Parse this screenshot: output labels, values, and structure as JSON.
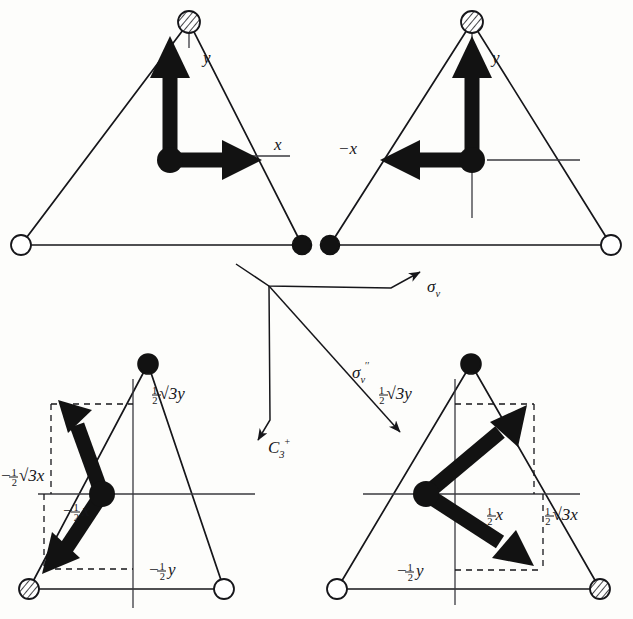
{
  "figure": {
    "colors": {
      "ink": "#16161a",
      "paper": "#fdfdfb",
      "vector": "#121212",
      "thin_line": "#3a3a3f"
    },
    "panels": [
      {
        "id": "top-left",
        "name": "original-orientation",
        "vertices": [
          {
            "position": "top",
            "marker": "hatched"
          },
          {
            "position": "bottom-left",
            "marker": "open"
          },
          {
            "position": "bottom-right",
            "marker": "filled"
          }
        ],
        "axis_labels": [
          {
            "text": "y",
            "name": "y-axis-label"
          },
          {
            "text": "x",
            "name": "x-axis-label"
          }
        ],
        "vectors": [
          {
            "name": "y-vector",
            "direction": "up",
            "label": "y"
          },
          {
            "name": "x-vector",
            "direction": "right",
            "label": "x"
          }
        ]
      },
      {
        "id": "top-right",
        "name": "sigma-v-reflected",
        "vertices": [
          {
            "position": "top",
            "marker": "hatched"
          },
          {
            "position": "bottom-left",
            "marker": "filled"
          },
          {
            "position": "bottom-right",
            "marker": "open"
          }
        ],
        "axis_labels": [
          {
            "text": "y",
            "name": "y-axis-label"
          },
          {
            "text": "−x",
            "name": "negative-x-axis-label"
          }
        ],
        "vectors": [
          {
            "name": "y-vector",
            "direction": "up",
            "label": "y"
          },
          {
            "name": "negative-x-vector",
            "direction": "left",
            "label": "−x"
          }
        ]
      },
      {
        "id": "bottom-left",
        "name": "c3-plus-rotated",
        "vertices": [
          {
            "position": "top",
            "marker": "filled"
          },
          {
            "position": "bottom-left",
            "marker": "hatched"
          },
          {
            "position": "bottom-right",
            "marker": "open"
          }
        ],
        "component_labels": [
          {
            "name": "half-root3-y-label",
            "parts": {
              "frac": "1/2",
              "radical": "√3",
              "var": "y"
            },
            "sign": ""
          },
          {
            "name": "negative-half-root3-x-label",
            "parts": {
              "frac": "1/2",
              "radical": "√3",
              "var": "x"
            },
            "sign": "−"
          },
          {
            "name": "negative-half-x-label",
            "parts": {
              "frac": "1/2",
              "radical": "",
              "var": "x"
            },
            "sign": "−"
          },
          {
            "name": "negative-half-y-label",
            "parts": {
              "frac": "1/2",
              "radical": "",
              "var": "y"
            },
            "sign": "−"
          }
        ],
        "vectors": [
          {
            "name": "rotated-y-vector",
            "direction": "up-left",
            "components": [
              "-1/2√3x",
              "1/2√3y"
            ]
          },
          {
            "name": "rotated-x-vector",
            "direction": "down-left",
            "components": [
              "-1/2x",
              "-1/2y"
            ]
          }
        ]
      },
      {
        "id": "bottom-right",
        "name": "sigma-v-double-prime-reflected",
        "vertices": [
          {
            "position": "top",
            "marker": "filled"
          },
          {
            "position": "bottom-left",
            "marker": "open"
          },
          {
            "position": "bottom-right",
            "marker": "hatched"
          }
        ],
        "component_labels": [
          {
            "name": "half-root3-y-label",
            "parts": {
              "frac": "1/2",
              "radical": "√3",
              "var": "y"
            },
            "sign": ""
          },
          {
            "name": "half-x-label",
            "parts": {
              "frac": "1/2",
              "radical": "",
              "var": "x"
            },
            "sign": ""
          },
          {
            "name": "half-root3-x-label",
            "parts": {
              "frac": "1/2",
              "radical": "√3",
              "var": "x"
            },
            "sign": ""
          },
          {
            "name": "negative-half-y-label",
            "parts": {
              "frac": "1/2",
              "radical": "",
              "var": "y"
            },
            "sign": "−"
          }
        ],
        "vectors": [
          {
            "name": "reflected-y-vector",
            "direction": "up-right",
            "components": [
              "1/2√3x",
              "1/2√3y"
            ]
          },
          {
            "name": "reflected-x-vector",
            "direction": "down-right",
            "components": [
              "1/2x",
              "-1/2y"
            ]
          }
        ]
      }
    ],
    "operations": [
      {
        "name": "sigma-v-operation",
        "symbol": "σ",
        "subscript": "v",
        "superscript": "",
        "arrow": "up-right",
        "from": "top-left-panel",
        "to": "top-right-panel"
      },
      {
        "name": "c3-plus-operation",
        "symbol": "C",
        "subscript": "3",
        "superscript": "+",
        "arrow": "down",
        "from": "top-left-panel",
        "to": "bottom-left-panel"
      },
      {
        "name": "sigma-v-double-prime-operation",
        "symbol": "σ",
        "subscript": "v",
        "superscript": "′′",
        "arrow": "down-right",
        "from": "top-left-panel",
        "to": "bottom-right-panel"
      }
    ]
  }
}
